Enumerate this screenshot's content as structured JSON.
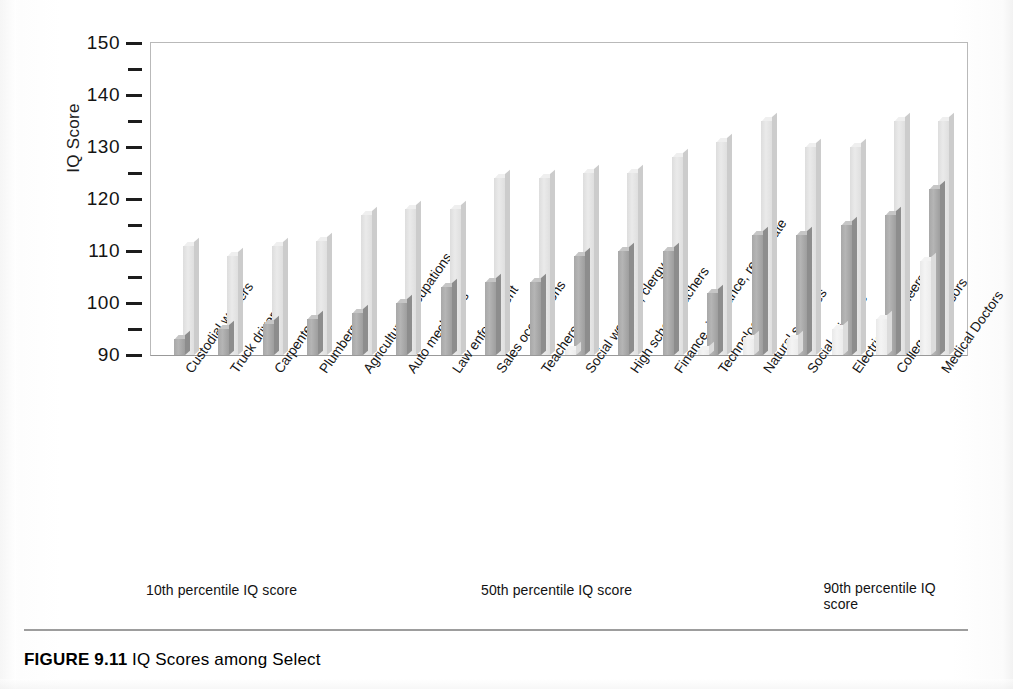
{
  "figure": {
    "caption_label": "FIGURE 9.11",
    "caption_text": "IQ Scores among Select"
  },
  "axes": {
    "y_title": "IQ Score",
    "y_ticks_major": [
      "150",
      "140",
      "130",
      "120",
      "110",
      "100",
      "90"
    ],
    "y_min": 90,
    "y_max": 150,
    "y_major_step": 10,
    "y_minor_step": 5
  },
  "legend": {
    "items": [
      {
        "label": "10th percentile IQ score",
        "color": "#efefef",
        "key": "p10"
      },
      {
        "label": "50th percentile IQ score",
        "color": "#a8a8a8",
        "key": "p50"
      },
      {
        "label": "90th percentile IQ score",
        "color": "#e2e2e2",
        "key": "p90"
      }
    ]
  },
  "chart_data": {
    "type": "bar",
    "xlabel": "",
    "ylabel": "IQ Score",
    "ylim": [
      90,
      150
    ],
    "grid": false,
    "legend_position": "bottom",
    "orientation": "vertical",
    "group_mode": "clustered",
    "categories": [
      "Custodial workers",
      "Truck drivers",
      "Carpenters",
      "Plumbers",
      "Agricultural occupations",
      "Auto mechanics",
      "Law enforcement",
      "Sales occupations",
      "Teachers, K-5",
      "Social workers, clergy",
      "High school teachers",
      "Finance, insurance, real estate",
      "Technology",
      "Natural sciences",
      "Social sciences",
      "Electrical engineers",
      "College professors",
      "Medical Doctors"
    ],
    "series": [
      {
        "name": "10th percentile IQ score",
        "color": "#efefef",
        "values": [
          86,
          87,
          88,
          88,
          89,
          89,
          89,
          90,
          90,
          91,
          90,
          90,
          91,
          93,
          93,
          95,
          97,
          108
        ]
      },
      {
        "name": "50th percentile IQ score",
        "color": "#a8a8a8",
        "values": [
          93,
          95,
          96,
          97,
          98,
          100,
          103,
          104,
          104,
          109,
          110,
          110,
          102,
          113,
          113,
          115,
          117,
          122
        ]
      },
      {
        "name": "90th percentile IQ score",
        "color": "#e2e2e2",
        "values": [
          111,
          109,
          111,
          112,
          117,
          118,
          118,
          124,
          124,
          125,
          125,
          128,
          131,
          135,
          130,
          130,
          135,
          135
        ]
      }
    ]
  }
}
